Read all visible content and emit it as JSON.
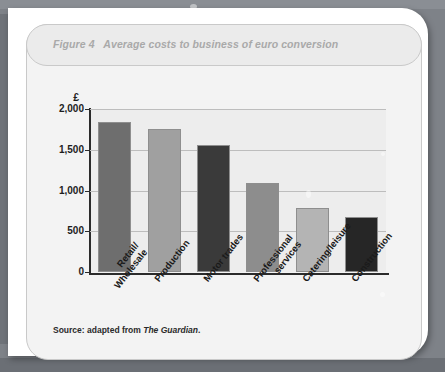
{
  "figure": {
    "title": "Figure 4   Average costs to business of euro conversion",
    "source_prefix": "Source: adapted from ",
    "source_publication": "The Guardian",
    "source_suffix": "."
  },
  "chart_data": {
    "type": "bar",
    "title": "Average costs to business of euro conversion",
    "xlabel": "",
    "ylabel": "£",
    "currency_symbol": "£",
    "ylim": [
      0,
      2000
    ],
    "ytick_labels": [
      "2,000",
      "1,500",
      "1,000",
      "500",
      "0"
    ],
    "ytick_values": [
      2000,
      1500,
      1000,
      500,
      0
    ],
    "grid": true,
    "legend": "none",
    "categories": [
      "Retail/\nWholesale",
      "Production",
      "Motor trades",
      "Professional\nservices",
      "Catering/leisure",
      "Construction"
    ],
    "category_lines": [
      [
        "Retail/",
        "Wholesale"
      ],
      [
        "Production"
      ],
      [
        "Motor trades"
      ],
      [
        "Professional",
        "services"
      ],
      [
        "Catering/leisure"
      ],
      [
        "Construction"
      ]
    ],
    "values": [
      1840,
      1750,
      1560,
      1090,
      790,
      675
    ],
    "bar_colors": [
      "#6e6e6e",
      "#a0a0a0",
      "#3a3a3a",
      "#8d8d8d",
      "#b4b4b4",
      "#262626"
    ],
    "plot_background": "#ededed",
    "gridline_color": "#bdbdbd",
    "axis_color": "#2b2b2b"
  }
}
